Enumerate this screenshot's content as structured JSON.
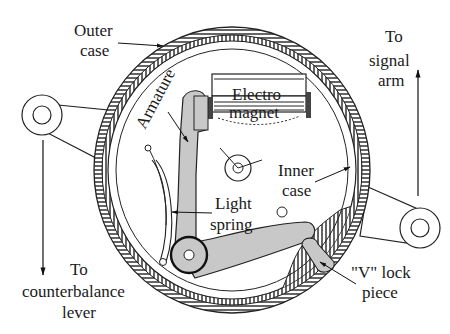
{
  "diagram": {
    "type": "mechanical cross-section",
    "labels": {
      "outer_case": [
        "Outer",
        "case"
      ],
      "armature": "Armature",
      "electromagnet": [
        "Electro",
        "magnet"
      ],
      "to_signal_arm": [
        "To",
        "signal",
        "arm"
      ],
      "inner_case": [
        "Inner",
        "case"
      ],
      "light_spring": [
        "Light",
        "spring"
      ],
      "to_counterbalance_lever": [
        "To",
        "counterbalance",
        "lever"
      ],
      "v_lock_piece": [
        "\"V\" lock",
        "piece"
      ]
    },
    "colors": {
      "line": "#1a1a1a",
      "part_fill": "#c8c8c8",
      "background": "#ffffff",
      "magnet_pole": "#444444"
    }
  }
}
